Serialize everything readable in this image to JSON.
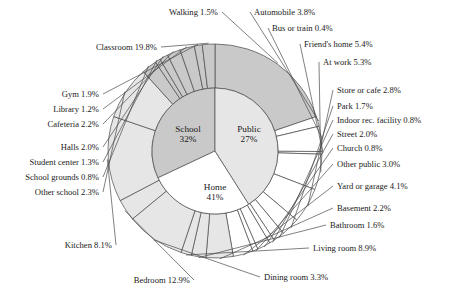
{
  "chart_data": {
    "type": "pie",
    "title": "",
    "subtitle": "",
    "xlabel": "",
    "ylabel": "",
    "legend_position": "none",
    "grid": false,
    "rings": [
      {
        "name": "inner",
        "label": "Location category",
        "categories": [
          "School",
          "Public",
          "Home"
        ],
        "values": [
          32,
          27,
          41
        ],
        "value_labels": [
          "32%",
          "27%",
          "41%"
        ],
        "colors": [
          "#c9c9c9",
          "#ffffff",
          "#e6e6e6"
        ]
      },
      {
        "name": "outer",
        "label": "Specific location",
        "categories": [
          "Classroom",
          "Walking",
          "Automobile",
          "Bus or train",
          "Friend's home",
          "At work",
          "Store or cafe",
          "Park",
          "Indoor rec. facility",
          "Street",
          "Church",
          "Other public",
          "Yard or garage",
          "Basement",
          "Bathroom",
          "Living room",
          "Dining room",
          "Bedroom",
          "Kitchen",
          "Other school",
          "School grounds",
          "Student center",
          "Halls",
          "Cafeteria",
          "Library",
          "Gym"
        ],
        "values": [
          19.8,
          1.5,
          3.8,
          0.4,
          5.4,
          5.3,
          2.8,
          1.7,
          0.8,
          2.0,
          0.8,
          3.0,
          4.1,
          2.2,
          1.6,
          8.9,
          3.3,
          12.9,
          8.1,
          2.3,
          0.8,
          1.3,
          2.0,
          2.2,
          1.2,
          1.9
        ],
        "parents": [
          "School",
          "Public",
          "Public",
          "Public",
          "Public",
          "Public",
          "Public",
          "Public",
          "Public",
          "Public",
          "Public",
          "Public",
          "Home",
          "Home",
          "Home",
          "Home",
          "Home",
          "Home",
          "Home",
          "School",
          "School",
          "School",
          "School",
          "School",
          "School",
          "School"
        ]
      }
    ],
    "annotations": [
      {
        "text": "Walking 1.5%",
        "anchor": "end",
        "x": 218,
        "y": 12
      },
      {
        "text": "Automobile 3.8%",
        "anchor": "start",
        "x": 254,
        "y": 12
      },
      {
        "text": "Bus or train 0.4%",
        "anchor": "start",
        "x": 272,
        "y": 28
      },
      {
        "text": "Friend's home 5.4%",
        "anchor": "start",
        "x": 304,
        "y": 44
      },
      {
        "text": "At work 5.3%",
        "anchor": "start",
        "x": 323,
        "y": 62
      },
      {
        "text": "Store or cafe 2.8%",
        "anchor": "start",
        "x": 337,
        "y": 90
      },
      {
        "text": "Park 1.7%",
        "anchor": "start",
        "x": 337,
        "y": 106
      },
      {
        "text": "Indoor rec. facility 0.8%",
        "anchor": "start",
        "x": 337,
        "y": 120
      },
      {
        "text": "Street 2.0%",
        "anchor": "start",
        "x": 337,
        "y": 134
      },
      {
        "text": "Church 0.8%",
        "anchor": "start",
        "x": 337,
        "y": 148
      },
      {
        "text": "Other public 3.0%",
        "anchor": "start",
        "x": 337,
        "y": 164
      },
      {
        "text": "Yard or garage 4.1%",
        "anchor": "start",
        "x": 337,
        "y": 186
      },
      {
        "text": "Basement 2.2%",
        "anchor": "start",
        "x": 337,
        "y": 208
      },
      {
        "text": "Bathroom 1.6%",
        "anchor": "start",
        "x": 330,
        "y": 225
      },
      {
        "text": "Living room 8.9%",
        "anchor": "start",
        "x": 313,
        "y": 248
      },
      {
        "text": "Dining room 3.3%",
        "anchor": "start",
        "x": 264,
        "y": 277
      },
      {
        "text": "Bedroom 12.9%",
        "anchor": "end",
        "x": 190,
        "y": 280
      },
      {
        "text": "Kitchen 8.1%",
        "anchor": "end",
        "x": 112,
        "y": 245
      },
      {
        "text": "Other school 2.3%",
        "anchor": "end",
        "x": 99,
        "y": 192
      },
      {
        "text": "School grounds 0.8%",
        "anchor": "end",
        "x": 99,
        "y": 177
      },
      {
        "text": "Student center 1.3%",
        "anchor": "end",
        "x": 99,
        "y": 162
      },
      {
        "text": "Halls 2.0%",
        "anchor": "end",
        "x": 99,
        "y": 147
      },
      {
        "text": "Cafeteria 2.2%",
        "anchor": "end",
        "x": 99,
        "y": 124
      },
      {
        "text": "Library 1.2%",
        "anchor": "end",
        "x": 99,
        "y": 109
      },
      {
        "text": "Gym 1.9%",
        "anchor": "end",
        "x": 99,
        "y": 94
      },
      {
        "text": "Classroom 19.8%",
        "anchor": "end",
        "x": 157,
        "y": 47
      }
    ],
    "geometry": {
      "cx": 215,
      "cy": 151,
      "inner_radius": 63,
      "outer_radius": 107,
      "start_angle_deg": 0,
      "direction": "clockwise"
    }
  }
}
